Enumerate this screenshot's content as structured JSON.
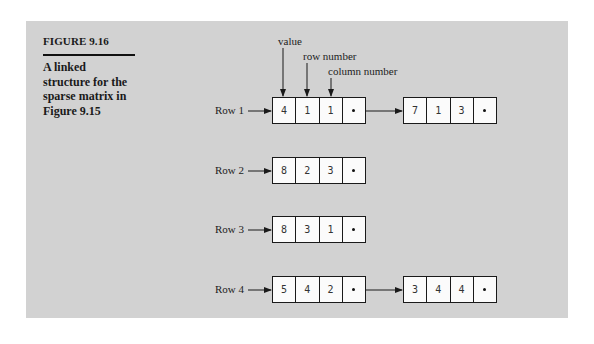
{
  "figure": {
    "label": "FIGURE 9.16",
    "caption_lines": [
      "A linked",
      "structure for the",
      "sparse matrix in",
      "Figure 9.15"
    ]
  },
  "annotations": {
    "value": "value",
    "row_number": "row number",
    "column_number": "column number"
  },
  "rows": [
    {
      "label": "Row 1",
      "nodes": [
        {
          "value": "4",
          "row": "1",
          "col": "1",
          "next": "pointer"
        },
        {
          "value": "7",
          "row": "1",
          "col": "3",
          "next": "null"
        }
      ]
    },
    {
      "label": "Row 2",
      "nodes": [
        {
          "value": "8",
          "row": "2",
          "col": "3",
          "next": "null"
        }
      ]
    },
    {
      "label": "Row 3",
      "nodes": [
        {
          "value": "8",
          "row": "3",
          "col": "1",
          "next": "null"
        }
      ]
    },
    {
      "label": "Row 4",
      "nodes": [
        {
          "value": "5",
          "row": "4",
          "col": "2",
          "next": "pointer"
        },
        {
          "value": "3",
          "row": "4",
          "col": "4",
          "next": "null"
        }
      ]
    }
  ],
  "colors": {
    "panel_background": "#d2d2d2",
    "page_background": "#ffffff",
    "ink": "#1a1a1a",
    "node_fill": "#fbfbfb"
  }
}
